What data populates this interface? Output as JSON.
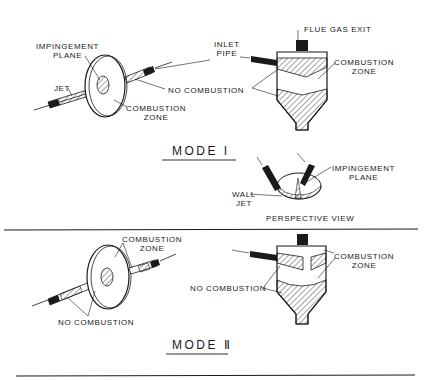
{
  "mode1": {
    "title": "MODE I",
    "jet_diagram": {
      "impingement_plane_line1": "IMPINGEMENT",
      "impingement_plane_line2": "PLANE",
      "jet": "JET",
      "combustion_zone_line1": "COMBUSTION",
      "combustion_zone_line2": "ZONE"
    },
    "shared": {
      "no_combustion": "NO COMBUSTION"
    },
    "reactor": {
      "inlet_pipe_line1": "INLET",
      "inlet_pipe_line2": "PIPE",
      "flue_gas_exit": "FLUE GAS EXIT",
      "combustion_zone_line1": "COMBUSTION",
      "combustion_zone_line2": "ZONE"
    },
    "perspective": {
      "impingement_plane_line1": "IMPINGEMENT",
      "impingement_plane_line2": "PLANE",
      "wall_jet_line1": "WALL",
      "wall_jet_line2": "JET",
      "caption": "PERSPECTIVE VIEW"
    }
  },
  "mode2": {
    "title": "MODE Ⅱ",
    "jet_diagram": {
      "combustion_zone_line1": "COMBUSTION",
      "combustion_zone_line2": "ZONE",
      "no_combustion": "NO COMBUSTION"
    },
    "reactor": {
      "no_combustion": "NO COMBUSTION",
      "combustion_zone_line1": "COMBUSTION",
      "combustion_zone_line2": "ZONE"
    }
  },
  "colors": {
    "ink": "#1a1a1a",
    "background": "#ffffff"
  }
}
